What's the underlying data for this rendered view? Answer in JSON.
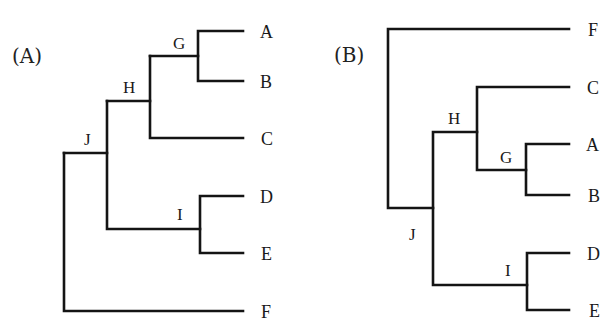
{
  "figure": {
    "line_color": "#141414",
    "background": "#ffffff"
  },
  "trees": [
    {
      "panel_label": "(A)",
      "leaves": {
        "A": "A",
        "B": "B",
        "C": "C",
        "D": "D",
        "E": "E",
        "F": "F"
      },
      "nodes": {
        "G": "G",
        "H": "H",
        "I": "I",
        "J": "J"
      },
      "topology": "((((A,B)G,C)H,(D,E)I)J,F)"
    },
    {
      "panel_label": "(B)",
      "leaves": {
        "A": "A",
        "B": "B",
        "C": "C",
        "D": "D",
        "E": "E",
        "F": "F"
      },
      "nodes": {
        "G": "G",
        "H": "H",
        "I": "I",
        "J": "J"
      },
      "topology": "(F,((C,(A,B)G)H,(D,E)I)J)"
    }
  ]
}
